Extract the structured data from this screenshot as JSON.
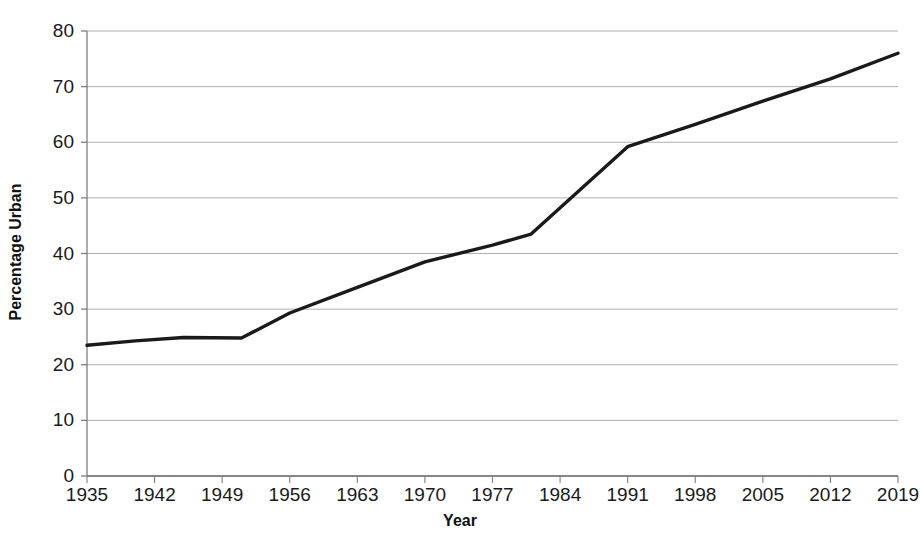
{
  "chart_data": {
    "type": "line",
    "title": "",
    "xlabel": "Year",
    "ylabel": "Percentage Urban",
    "xlim": [
      1935,
      2019
    ],
    "ylim": [
      0,
      80
    ],
    "grid": true,
    "legend": "none",
    "series_color": "#1a1a1a",
    "x_ticks": [
      "1935",
      "1942",
      "1949",
      "1956",
      "1963",
      "1970",
      "1977",
      "1984",
      "1991",
      "1998",
      "2005",
      "2012",
      "2019"
    ],
    "y_ticks": [
      "0",
      "10",
      "20",
      "30",
      "40",
      "50",
      "60",
      "70",
      "80"
    ],
    "x": [
      1935,
      1940,
      1945,
      1951,
      1956,
      1963,
      1970,
      1977,
      1981,
      1991,
      1998,
      2005,
      2012,
      2019
    ],
    "values": [
      23.5,
      24.3,
      24.9,
      24.8,
      29.3,
      33.9,
      38.5,
      41.5,
      43.5,
      59.2,
      63.2,
      67.4,
      71.4,
      76.0
    ],
    "series": [
      {
        "name": "Percentage Urban",
        "values": [
          23.5,
          24.3,
          24.9,
          24.8,
          29.3,
          33.9,
          38.5,
          41.5,
          43.5,
          59.2,
          63.2,
          67.4,
          71.4,
          76.0
        ]
      }
    ]
  },
  "axes": {
    "x_title": "Year",
    "y_title": "Percentage Urban"
  },
  "colors": {
    "line": "#1a1a1a",
    "grid": "#a6a6a6",
    "axis": "#7f7f7f",
    "background": "#ffffff",
    "text": "#1a1a1a"
  }
}
